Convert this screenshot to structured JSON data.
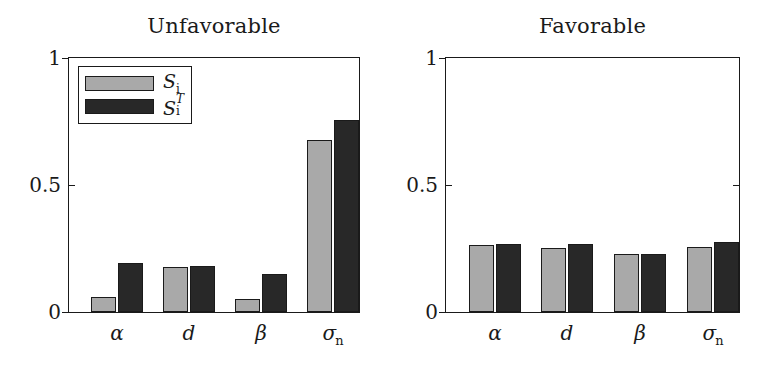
{
  "figure": {
    "background": "#ffffff",
    "series_colors": {
      "S_i": "#a9a9a9",
      "S_i_total": "#282828"
    },
    "axis_color": "#1a1a1a"
  },
  "legend": {
    "entries": [
      {
        "key": "S_i",
        "symbol": "S",
        "sub": "i",
        "sup": "",
        "color": "#a9a9a9"
      },
      {
        "key": "S_i_total",
        "symbol": "S",
        "sub": "i",
        "sup": "T",
        "color": "#282828"
      }
    ]
  },
  "panels": [
    {
      "id": "unfavorable",
      "title": "Unfavorable",
      "ylim": [
        0,
        1
      ],
      "yticks": [
        "0",
        "0.5",
        "1"
      ],
      "ytick_values": [
        0,
        0.5,
        1
      ],
      "categories": [
        "α",
        "d",
        "β",
        "σn"
      ],
      "category_labels": [
        {
          "base": "α",
          "sub": ""
        },
        {
          "base": "d",
          "sub": ""
        },
        {
          "base": "β",
          "sub": ""
        },
        {
          "base": "σ",
          "sub": "n"
        }
      ],
      "series": [
        {
          "name": "S_i",
          "values": [
            0.058,
            0.175,
            0.05,
            0.67
          ]
        },
        {
          "name": "S_i^T",
          "values": [
            0.19,
            0.18,
            0.148,
            0.75
          ]
        }
      ]
    },
    {
      "id": "favorable",
      "title": "Favorable",
      "ylim": [
        0,
        1
      ],
      "yticks": [
        "0",
        "0.5",
        "1"
      ],
      "ytick_values": [
        0,
        0.5,
        1
      ],
      "categories": [
        "α",
        "d",
        "β",
        "σn"
      ],
      "category_labels": [
        {
          "base": "α",
          "sub": ""
        },
        {
          "base": "d",
          "sub": ""
        },
        {
          "base": "β",
          "sub": ""
        },
        {
          "base": "σ",
          "sub": "n"
        }
      ],
      "series": [
        {
          "name": "S_i",
          "values": [
            0.26,
            0.25,
            0.225,
            0.255
          ]
        },
        {
          "name": "S_i^T",
          "values": [
            0.265,
            0.265,
            0.228,
            0.275
          ]
        }
      ]
    }
  ],
  "chart_data": {
    "type": "bar",
    "title": "",
    "xlabel": "",
    "ylabel": "",
    "ylim": [
      0,
      1
    ],
    "yticks": [
      0,
      0.5,
      1
    ],
    "grid": false,
    "legend_position": "upper-left (Unfavorable panel)",
    "categories": [
      "α",
      "d",
      "β",
      "σn"
    ],
    "subplots": [
      {
        "title": "Unfavorable",
        "series": [
          {
            "name": "S_i",
            "values": [
              0.058,
              0.175,
              0.05,
              0.67
            ],
            "color": "#a9a9a9"
          },
          {
            "name": "S_i^T",
            "values": [
              0.19,
              0.18,
              0.148,
              0.75
            ],
            "color": "#282828"
          }
        ]
      },
      {
        "title": "Favorable",
        "series": [
          {
            "name": "S_i",
            "values": [
              0.26,
              0.25,
              0.225,
              0.255
            ],
            "color": "#a9a9a9"
          },
          {
            "name": "S_i^T",
            "values": [
              0.265,
              0.265,
              0.228,
              0.275
            ],
            "color": "#282828"
          }
        ]
      }
    ]
  }
}
